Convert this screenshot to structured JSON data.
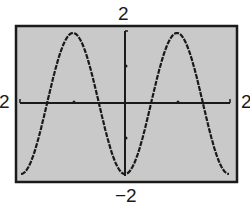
{
  "labels": {
    "ymax": "2",
    "ymin": "−2",
    "xmin": "2",
    "xmax": "2"
  },
  "colors": {
    "screen_bg": "#c8c8c8",
    "frame": "#1a1a1a",
    "curve": "#1a1a1a",
    "axis": "#1a1a1a"
  },
  "chart_data": {
    "type": "line",
    "title": "",
    "function": "y = -2cos(x)",
    "xlabel": "",
    "ylabel": "",
    "xlim": [
      -6.283,
      6.283
    ],
    "ylim": [
      -2,
      2
    ],
    "x_ticks": [
      -3.1416,
      3.1416
    ],
    "y_ticks": [
      -1,
      1
    ],
    "grid": false,
    "legend": null,
    "window_labels": {
      "top": "2",
      "bottom": "-2",
      "left": "2 (cropped)",
      "right": "2 (cropped)"
    },
    "series": [
      {
        "name": "y = -2cos(x)",
        "x": [
          -6.283,
          -4.712,
          -3.142,
          -1.571,
          0,
          1.571,
          3.142,
          4.712,
          6.283
        ],
        "values": [
          -2,
          0,
          2,
          0,
          -2,
          0,
          2,
          0,
          -2
        ]
      }
    ]
  }
}
